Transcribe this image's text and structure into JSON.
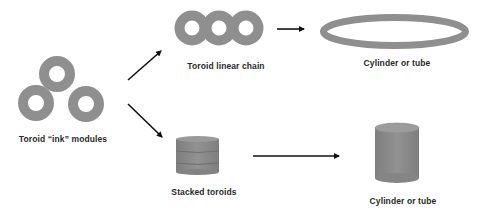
{
  "diagram": {
    "colors": {
      "shape_fill": "#8f8f8f",
      "shape_dark": "#7a7a7a",
      "arrow": "#111111",
      "text": "#2a2a2a",
      "background": "#ffffff"
    },
    "nodes": [
      {
        "id": "modules",
        "label": "Toroid “ink” modules",
        "shape": "three-toroids"
      },
      {
        "id": "chain",
        "label": "Toroid linear chain",
        "shape": "three-linked-toroids"
      },
      {
        "id": "tube-ring",
        "label": "Cylinder or tube",
        "shape": "elliptical-ring"
      },
      {
        "id": "stack",
        "label": "Stacked toroids",
        "shape": "stacked-disks"
      },
      {
        "id": "tube-solid",
        "label": "Cylinder or tube",
        "shape": "cylinder"
      }
    ],
    "edges": [
      {
        "from": "modules",
        "to": "chain"
      },
      {
        "from": "modules",
        "to": "stack"
      },
      {
        "from": "chain",
        "to": "tube-ring"
      },
      {
        "from": "stack",
        "to": "tube-solid"
      }
    ]
  }
}
